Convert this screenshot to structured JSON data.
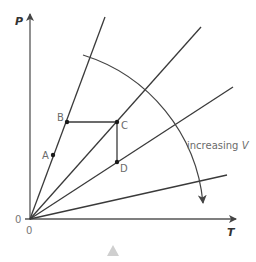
{
  "diagram": {
    "y_axis_label": "P",
    "x_axis_label": "T",
    "origin_x_label": "0",
    "origin_y_label": "0",
    "annotation": {
      "text": "increasing ",
      "variable": "V"
    },
    "points": [
      {
        "label": "A",
        "x": 53,
        "y": 155
      },
      {
        "label": "B",
        "x": 67,
        "y": 122
      },
      {
        "label": "C",
        "x": 117,
        "y": 122
      },
      {
        "label": "D",
        "x": 117,
        "y": 162
      }
    ],
    "colors": {
      "line": "#3a3a3a",
      "text": "#6b6b6b",
      "nav_triangle": "#cfcfcf"
    }
  },
  "nav": {
    "triangle_icon": "up-triangle"
  }
}
